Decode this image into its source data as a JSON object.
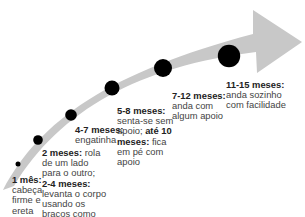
{
  "colors": {
    "arrow": "#c8c8c8",
    "dot": "#000000",
    "text": "#444444"
  },
  "milestones": [
    {
      "age": "1 mês:",
      "lines": [
        "cabeça",
        "firme e",
        "ereta"
      ]
    },
    {
      "age": "2 meses:",
      "line1_rest": " rola",
      "lines": [
        "de um lado",
        "para o outro;"
      ],
      "age2": "2-4 meses:",
      "lines2": [
        "levanta o corpo",
        "usando os",
        "braços como",
        "apoio"
      ]
    },
    {
      "age": "4-7 meses:",
      "lines": [
        "engatinha"
      ]
    },
    {
      "age": "5-8 meses:",
      "lines_a": "senta-se sem",
      "line_b_pre": "apoio; ",
      "age2": "até 10",
      "age2b": "meses:",
      "line_c_rest": " fica",
      "lines": [
        "em pé com",
        "apoio"
      ]
    },
    {
      "age": "7-12 meses:",
      "lines": [
        "anda com",
        "algum apoio"
      ]
    },
    {
      "age": "11-15 meses:",
      "lines": [
        "anda sozinho",
        "com facilidade"
      ]
    }
  ]
}
